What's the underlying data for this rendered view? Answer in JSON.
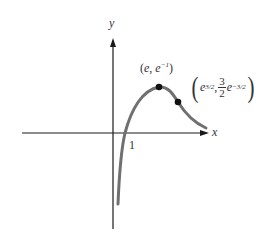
{
  "figure": {
    "axes": {
      "x_label": "x",
      "y_label": "y",
      "tick_x": "1"
    },
    "curve": {
      "function": "ln(x)/x",
      "color": "#707070"
    },
    "points": [
      {
        "name": "maximum",
        "label_open": "(",
        "label_x": "e",
        "label_sep": ", ",
        "label_y_base": "e",
        "label_y_exp": "−1",
        "label_close": ")"
      },
      {
        "name": "inflection",
        "label_open": "(",
        "label_x_base": "e",
        "label_x_exp": "3/2",
        "label_sep": ",",
        "frac_num": "3",
        "frac_den": "2",
        "label_y_base": "e",
        "label_y_exp": "−3/2",
        "label_close": ")"
      }
    ],
    "colors": {
      "axis": "#1a1a1a",
      "curve": "#707070",
      "point": "#111111"
    }
  }
}
